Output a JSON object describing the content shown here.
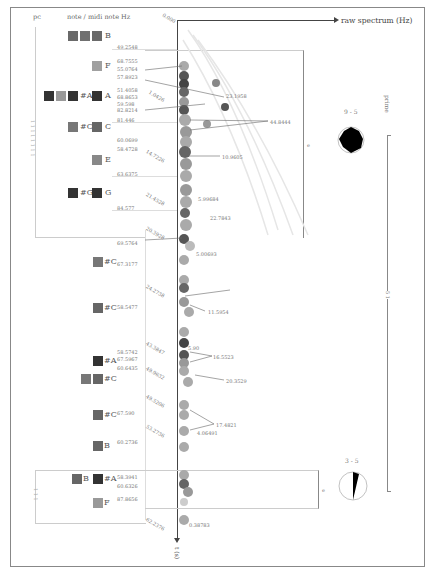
{
  "figure": {
    "left_header_pc": "pc",
    "left_header": "note / midi note Hz",
    "top_axis_label": "raw spectrum (Hz)",
    "bottom_axis_label": "t (s)",
    "top_corner_label": "0.000",
    "right_label": "prime",
    "right_bracket_label": "5 1",
    "left_bracket_label": "1 1 1 1 1 1 1 1",
    "left_bracket2_label": "1 1 1",
    "dial_top": {
      "label": "9 - 5"
    },
    "dial_bottom": {
      "label": "3 - 5"
    },
    "box_label_upper": "e",
    "box_label_lower": "e"
  },
  "notes": [
    {
      "name": "B",
      "y": 11,
      "squares": [
        "#6a6a6a",
        "#707070",
        "#6a6a6a"
      ]
    },
    {
      "name": "F",
      "y": 33,
      "squares": [
        "#a0a0a0"
      ]
    },
    {
      "name": "#A",
      "y": 63,
      "squares": [
        "#333",
        "#999",
        "#333"
      ]
    },
    {
      "name": "A",
      "y": 63,
      "squares": [
        "#333"
      ]
    },
    {
      "name": "#C",
      "y": 94,
      "squares": [
        "#777"
      ]
    },
    {
      "name": "C",
      "y": 94,
      "squares": [
        "#666"
      ]
    },
    {
      "name": "E",
      "y": 127,
      "squares": [
        "#888"
      ]
    },
    {
      "name": "#G",
      "y": 161,
      "squares": [
        "#333"
      ]
    },
    {
      "name": "G",
      "y": 161,
      "squares": [
        "#333"
      ]
    },
    {
      "name": "#C",
      "y": 227,
      "squares": [
        "#777"
      ]
    },
    {
      "name": "#C",
      "y": 296,
      "squares": [
        "#666"
      ]
    },
    {
      "name": "#A",
      "y": 349,
      "squares": [
        "#333"
      ]
    },
    {
      "name": "#C",
      "y": 373,
      "squares": [
        "#777",
        "#666"
      ]
    },
    {
      "name": "#C",
      "y": 409,
      "squares": [
        "#666"
      ]
    },
    {
      "name": "B",
      "y": 438,
      "squares": [
        "#666"
      ]
    },
    {
      "name": "B",
      "y": 477,
      "squares": [
        "#666"
      ]
    },
    {
      "name": "#A",
      "y": 477,
      "squares": [
        "#333"
      ]
    },
    {
      "name": "F",
      "y": 501,
      "squares": [
        "#999"
      ]
    }
  ],
  "freq_labels": [
    {
      "text": "49.2548",
      "y": 44
    },
    {
      "text": "68.7555",
      "y": 58
    },
    {
      "text": "55.0764",
      "y": 66
    },
    {
      "text": "57.8923",
      "y": 75
    },
    {
      "text": "51.4058",
      "y": 88
    },
    {
      "text": "68.8653",
      "y": 95
    },
    {
      "text": "59.598",
      "y": 101
    },
    {
      "text": "82.8214",
      "y": 107
    },
    {
      "text": "81.446",
      "y": 117
    },
    {
      "text": "60.0699",
      "y": 138
    },
    {
      "text": "58.4728",
      "y": 147
    },
    {
      "text": "63.6375",
      "y": 172
    },
    {
      "text": "84.577",
      "y": 205
    },
    {
      "text": "69.5764",
      "y": 241
    },
    {
      "text": "67.3177",
      "y": 262
    },
    {
      "text": "58.5477",
      "y": 305
    },
    {
      "text": "58.5742",
      "y": 350
    },
    {
      "text": "67.5967",
      "y": 357
    },
    {
      "text": "60.6435",
      "y": 366
    },
    {
      "text": "67.590",
      "y": 411
    },
    {
      "text": "60.2736",
      "y": 440
    },
    {
      "text": "58.3941",
      "y": 475
    },
    {
      "text": "60.6326",
      "y": 484
    },
    {
      "text": "87.8656",
      "y": 497
    }
  ],
  "time_labels": [
    {
      "text": "1.0426",
      "y": 95
    },
    {
      "text": "14.7226",
      "y": 155
    },
    {
      "text": "21.4528",
      "y": 198
    },
    {
      "text": "20.3928",
      "y": 232
    },
    {
      "text": "24.2738",
      "y": 290
    },
    {
      "text": "43.3847",
      "y": 347
    },
    {
      "text": "49.9632",
      "y": 372
    },
    {
      "text": "49.5206",
      "y": 400
    },
    {
      "text": "53.2736",
      "y": 430
    },
    {
      "text": "62.2376",
      "y": 523
    }
  ],
  "peak_labels": [
    {
      "text": "23.1958",
      "y": 95,
      "x": 226
    },
    {
      "text": "44.8444",
      "y": 121,
      "x": 270
    },
    {
      "text": "10.9605",
      "y": 156,
      "x": 222
    },
    {
      "text": "5.99684",
      "y": 198,
      "x": 198
    },
    {
      "text": "22.7843",
      "y": 217,
      "x": 210
    },
    {
      "text": "5.00693",
      "y": 253,
      "x": 196
    },
    {
      "text": "11.5954",
      "y": 311,
      "x": 208
    },
    {
      "text": "5.90",
      "y": 347,
      "x": 188
    },
    {
      "text": "16.5523",
      "y": 356,
      "x": 213
    },
    {
      "text": "20.3529",
      "y": 380,
      "x": 226
    },
    {
      "text": "17.4821",
      "y": 424,
      "x": 216
    },
    {
      "text": "4.06491",
      "y": 432,
      "x": 197
    },
    {
      "text": "0.38783",
      "y": 524,
      "x": 189
    }
  ]
}
